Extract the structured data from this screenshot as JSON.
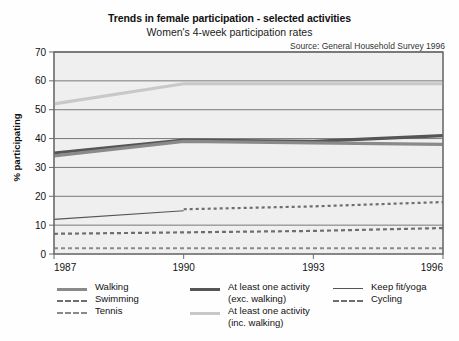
{
  "chart_data": {
    "type": "line",
    "title": "Trends in female participation - selected activities",
    "subtitle": "Women's 4-week participation rates",
    "source": "Source: General Household Survey 1996",
    "xlabel": "",
    "ylabel": "% participating",
    "xlim": [
      1987,
      1996
    ],
    "ylim": [
      0,
      70
    ],
    "ytick_step": 10,
    "yticks": [
      "0",
      "10",
      "20",
      "30",
      "40",
      "50",
      "60",
      "70"
    ],
    "xticks": [
      "1987",
      "1990",
      "1993",
      "1996"
    ],
    "xtick_values": [
      1987,
      1990,
      1993,
      1996
    ],
    "x": [
      1987,
      1990,
      1993,
      1996
    ],
    "grid": "horizontal",
    "legend_position": "below",
    "series": [
      {
        "name": "At least one activity (inc. walking)",
        "color": "#c8c8c8",
        "width": 3.2,
        "dash": "none",
        "x": [
          1987,
          1990,
          1993,
          1996
        ],
        "values": [
          52,
          59,
          59,
          59
        ]
      },
      {
        "name": "At least one activity (exc. walking)",
        "color": "#555555",
        "width": 3.2,
        "dash": "none",
        "x": [
          1987,
          1990,
          1993,
          1996
        ],
        "values": [
          35,
          39.5,
          39,
          41
        ]
      },
      {
        "name": "Walking",
        "color": "#8a8a8a",
        "width": 3.2,
        "dash": "none",
        "x": [
          1987,
          1990,
          1993,
          1996
        ],
        "values": [
          34,
          39,
          38.5,
          38
        ]
      },
      {
        "name": "Keep fit/yoga",
        "color": "#555555",
        "width": 1.1,
        "dash": "none",
        "x": [
          1987,
          1990
        ],
        "values": [
          12,
          15
        ]
      },
      {
        "name": "Cycling",
        "color": "#6e6e6e",
        "width": 2.2,
        "dash": "3 3",
        "x": [
          1990,
          1993,
          1996
        ],
        "values": [
          15.5,
          16.5,
          18
        ]
      },
      {
        "name": "Swimming",
        "color": "#6e6e6e",
        "width": 2.2,
        "dash": "4 3",
        "x": [
          1987,
          1990,
          1993,
          1996
        ],
        "values": [
          7,
          7.5,
          8,
          9
        ]
      },
      {
        "name": "Tennis",
        "color": "#8a8a8a",
        "width": 2.2,
        "dash": "4 3",
        "x": [
          1987,
          1990,
          1993,
          1996
        ],
        "values": [
          2,
          2,
          2,
          2
        ]
      }
    ],
    "legend": [
      {
        "label": "Walking",
        "label2": "",
        "color": "#8a8a8a",
        "width": 3.2,
        "dash": "none",
        "col": 0,
        "row": 0
      },
      {
        "label": "Swimming",
        "label2": "",
        "color": "#6e6e6e",
        "width": 2.2,
        "dash": "4 3",
        "col": 0,
        "row": 1
      },
      {
        "label": "Tennis",
        "label2": "",
        "color": "#8a8a8a",
        "width": 2.2,
        "dash": "4 3",
        "col": 0,
        "row": 2
      },
      {
        "label": "At least one activity",
        "label2": "(exc. walking)",
        "color": "#555555",
        "width": 3.2,
        "dash": "none",
        "col": 1,
        "row": 0
      },
      {
        "label": "At least one activity",
        "label2": "(inc. walking)",
        "color": "#c8c8c8",
        "width": 3.2,
        "dash": "none",
        "col": 1,
        "row": 2
      },
      {
        "label": "Keep fit/yoga",
        "label2": "",
        "color": "#555555",
        "width": 1.1,
        "dash": "none",
        "col": 2,
        "row": 0
      },
      {
        "label": "Cycling",
        "label2": "",
        "color": "#6e6e6e",
        "width": 2.2,
        "dash": "3 3",
        "col": 2,
        "row": 1
      }
    ],
    "style": {
      "panel_bg": "#efefef",
      "panel_border": "#6b6b6b",
      "grid_color": "#6b6b6b",
      "figure_bg": "#fefefe"
    }
  }
}
